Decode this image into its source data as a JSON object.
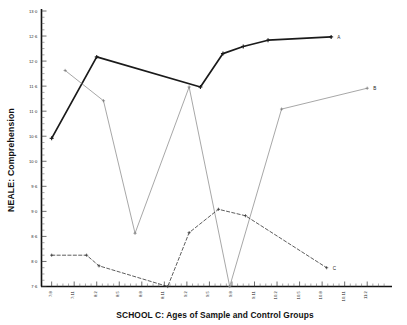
{
  "chart_data": {
    "type": "line",
    "title": "",
    "xlabel": "SCHOOL C: Ages of Sample and Control Groups",
    "ylabel": "NEALE: Comprehension",
    "ylim": [
      7.6,
      13.0
    ],
    "ytick_labels": [
      "13·0",
      "12·6",
      "12·0",
      "11·6",
      "11·0",
      "10·6",
      "10·0",
      "9·6",
      "9·0",
      "8·6",
      "8·0",
      "7·6"
    ],
    "ytick_values": [
      13.0,
      12.6,
      12.0,
      11.6,
      11.0,
      10.6,
      10.0,
      9.6,
      9.0,
      8.6,
      8.0,
      7.6
    ],
    "grid": false,
    "legend_position": "right-inline",
    "categories": [
      "7:8",
      "7:11",
      "8:2",
      "8:5",
      "8:8",
      "8:11",
      "9:2",
      "9:5",
      "9:8",
      "9:11",
      "10:2",
      "10:5",
      "10:8",
      "10:11",
      "11:2"
    ],
    "xtick_labels": [
      "7:8",
      "7:11",
      "8:2",
      "8:5",
      "8:8",
      "8:11",
      "9:2",
      "9:5",
      "9:8",
      "9:11",
      "10:2",
      "10:5",
      "10:8",
      "10:11",
      "11:2"
    ],
    "series": [
      {
        "name": "A",
        "style": "solid-thick",
        "color": "#1a1a1a",
        "label_text": "A",
        "x": [
          "7:8",
          "8:2",
          "9:5",
          "9:8",
          "9:11",
          "10:2",
          "10:11"
        ],
        "values": [
          10.55,
          12.1,
          11.58,
          12.18,
          12.35,
          12.5,
          12.58
        ],
        "points": [
          {
            "x": 0.0,
            "y": 10.55
          },
          {
            "x": 2.0,
            "y": 12.1
          },
          {
            "x": 6.6,
            "y": 11.58
          },
          {
            "x": 7.6,
            "y": 12.18
          },
          {
            "x": 8.5,
            "y": 12.35
          },
          {
            "x": 9.6,
            "y": 12.5
          },
          {
            "x": 12.4,
            "y": 12.58
          }
        ]
      },
      {
        "name": "B",
        "style": "solid-thin",
        "color": "#777777",
        "label_text": "B",
        "x": [
          "7:10",
          "8:3",
          "8:7",
          "9:2",
          "9:8",
          "10:3",
          "11:2"
        ],
        "values": [
          11.85,
          11.25,
          8.65,
          11.58,
          7.6,
          11.05,
          11.55
        ],
        "points": [
          {
            "x": 0.6,
            "y": 11.85
          },
          {
            "x": 2.3,
            "y": 11.25
          },
          {
            "x": 3.7,
            "y": 8.65
          },
          {
            "x": 6.1,
            "y": 11.58
          },
          {
            "x": 7.9,
            "y": 7.6
          },
          {
            "x": 10.2,
            "y": 11.05
          },
          {
            "x": 14.0,
            "y": 11.55
          }
        ]
      },
      {
        "name": "C",
        "style": "dashed",
        "color": "#333333",
        "label_text": "C",
        "x": [
          "7:8",
          "8:0",
          "8:2",
          "8:11",
          "9:2",
          "9:8",
          "9:11",
          "10:8"
        ],
        "values": [
          8.15,
          8.15,
          7.93,
          7.6,
          8.66,
          9.05,
          8.93,
          7.9
        ],
        "points": [
          {
            "x": 0.0,
            "y": 8.15
          },
          {
            "x": 1.55,
            "y": 8.15
          },
          {
            "x": 2.1,
            "y": 7.93
          },
          {
            "x": 5.15,
            "y": 7.6
          },
          {
            "x": 6.1,
            "y": 8.66
          },
          {
            "x": 7.4,
            "y": 9.05
          },
          {
            "x": 8.6,
            "y": 8.93
          },
          {
            "x": 12.2,
            "y": 7.9
          }
        ]
      }
    ]
  },
  "axes": {
    "y_axis_title": "NEALE: Comprehension",
    "x_axis_title": "SCHOOL C: Ages of Sample and Control Groups"
  },
  "series_labels": {
    "a": "A",
    "b": "B",
    "c": "C"
  },
  "colors": {
    "series_a": "#1a1a1a",
    "series_b": "#777777",
    "series_c": "#333333",
    "axis": "#111111",
    "background": "#ffffff"
  }
}
